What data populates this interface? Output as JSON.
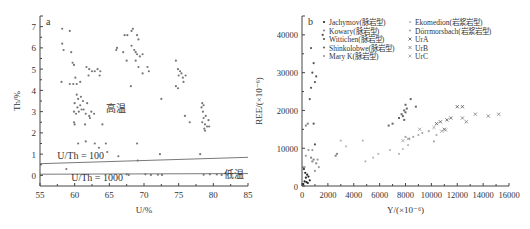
{
  "chart_data": [
    {
      "panel": "a",
      "type": "scatter",
      "title": "",
      "xlabel": "U/%",
      "ylabel": "Th/%",
      "xlim": [
        55,
        85
      ],
      "ylim": [
        -0.5,
        7.5
      ],
      "xticks": [
        55,
        60,
        65,
        70,
        75,
        80,
        85
      ],
      "yticks": [
        0,
        1,
        2,
        3,
        4,
        5,
        6,
        7
      ],
      "grid": false,
      "annotations": [
        {
          "text": "高温",
          "x": 64.5,
          "y": 3.0
        },
        {
          "text": "低温",
          "x": 81.5,
          "y": -0.1
        },
        {
          "text": "U/Th = 100",
          "x": 57.5,
          "y": 0.75
        },
        {
          "text": "U/Th = 1000",
          "x": 59.5,
          "y": -0.25
        }
      ],
      "lines": [
        {
          "label": "U/Th = 100",
          "x": [
            55,
            85
          ],
          "y": [
            0.55,
            0.85
          ]
        },
        {
          "label": "U/Th = 1000",
          "x": [
            55,
            85
          ],
          "y": [
            0.055,
            0.085
          ]
        }
      ],
      "series": [
        {
          "name": "samples",
          "points": [
            [
              58.2,
              6.9
            ],
            [
              59.3,
              6.8
            ],
            [
              58.2,
              6.2
            ],
            [
              58.4,
              5.9
            ],
            [
              59.5,
              5.8
            ],
            [
              59.7,
              5.3
            ],
            [
              59.9,
              5.2
            ],
            [
              58.1,
              4.4
            ],
            [
              59.3,
              4.3
            ],
            [
              59.8,
              4.3
            ],
            [
              60.3,
              4.3
            ],
            [
              60.8,
              4.4
            ],
            [
              60.1,
              4.6
            ],
            [
              61.7,
              5.1
            ],
            [
              62.1,
              5.0
            ],
            [
              62.5,
              4.9
            ],
            [
              62.9,
              4.9
            ],
            [
              63.3,
              5.0
            ],
            [
              63.7,
              4.9
            ],
            [
              62.0,
              4.7
            ],
            [
              63.6,
              4.7
            ],
            [
              60.3,
              3.8
            ],
            [
              60.5,
              3.6
            ],
            [
              60.9,
              3.7
            ],
            [
              61.2,
              3.5
            ],
            [
              60.0,
              3.4
            ],
            [
              60.4,
              3.2
            ],
            [
              60.8,
              3.3
            ],
            [
              61.3,
              3.1
            ],
            [
              61.8,
              3.4
            ],
            [
              59.9,
              3.0
            ],
            [
              60.2,
              2.9
            ],
            [
              60.6,
              3.0
            ],
            [
              61.0,
              3.1
            ],
            [
              61.6,
              2.9
            ],
            [
              62.1,
              2.8
            ],
            [
              62.4,
              3.0
            ],
            [
              62.8,
              2.9
            ],
            [
              62.2,
              2.7
            ],
            [
              59.9,
              2.5
            ],
            [
              60.0,
              2.4
            ],
            [
              61.5,
              2.4
            ],
            [
              64.0,
              2.4
            ],
            [
              60.5,
              1.5
            ],
            [
              61.6,
              1.6
            ],
            [
              62.9,
              1.5
            ],
            [
              64.5,
              1.5
            ],
            [
              63.5,
              1.3
            ],
            [
              64.7,
              1.1
            ],
            [
              66.3,
              0.9
            ],
            [
              58.8,
              0.3
            ],
            [
              66.1,
              6.0
            ],
            [
              66.0,
              5.9
            ],
            [
              67.2,
              6.6
            ],
            [
              67.6,
              6.6
            ],
            [
              68.4,
              6.9
            ],
            [
              68.2,
              6.8
            ],
            [
              69.0,
              6.6
            ],
            [
              69.2,
              6.4
            ],
            [
              68.2,
              6.1
            ],
            [
              68.6,
              5.9
            ],
            [
              67.0,
              5.8
            ],
            [
              68.8,
              5.8
            ],
            [
              69.0,
              5.7
            ],
            [
              69.4,
              5.6
            ],
            [
              69.8,
              5.7
            ],
            [
              68.8,
              5.4
            ],
            [
              67.5,
              5.4
            ],
            [
              69.2,
              5.1
            ],
            [
              70.5,
              5.1
            ],
            [
              70.7,
              4.9
            ],
            [
              69.8,
              4.8
            ],
            [
              68.1,
              4.2
            ],
            [
              72.5,
              3.6
            ],
            [
              69.0,
              1.5
            ],
            [
              72.3,
              1.0
            ],
            [
              69.1,
              0.7
            ],
            [
              74.6,
              5.4
            ],
            [
              74.9,
              5.0
            ],
            [
              75.2,
              4.9
            ],
            [
              75.0,
              4.7
            ],
            [
              75.4,
              4.8
            ],
            [
              75.6,
              4.6
            ],
            [
              76.0,
              4.7
            ],
            [
              75.7,
              4.4
            ],
            [
              74.6,
              4.2
            ],
            [
              74.9,
              4.1
            ],
            [
              75.9,
              2.8
            ],
            [
              76.6,
              2.5
            ],
            [
              78.4,
              3.4
            ],
            [
              78.6,
              3.3
            ],
            [
              78.3,
              3.2
            ],
            [
              78.5,
              3.0
            ],
            [
              78.9,
              2.8
            ],
            [
              78.6,
              2.7
            ],
            [
              79.3,
              2.6
            ],
            [
              78.4,
              2.5
            ],
            [
              78.8,
              2.4
            ],
            [
              79.1,
              2.3
            ],
            [
              78.7,
              2.2
            ],
            [
              79.4,
              2.3
            ],
            [
              78.8,
              2.1
            ],
            [
              78.1,
              1.0
            ],
            [
              67.5,
              0.05
            ],
            [
              67.8,
              0.02
            ],
            [
              70.2,
              0.05
            ],
            [
              71.0,
              0.02
            ],
            [
              72.0,
              0.03
            ],
            [
              72.6,
              0.02
            ],
            [
              78.6,
              0.03
            ],
            [
              79.5,
              0.05
            ],
            [
              80.5,
              0.04
            ],
            [
              81.2,
              0.02
            ],
            [
              82.0,
              0.03
            ],
            [
              82.6,
              0.02
            ]
          ]
        }
      ]
    },
    {
      "panel": "b",
      "type": "scatter",
      "title": "",
      "xlabel": "Y/(×10⁻⁶)",
      "ylabel": "REE/(×10⁻⁶)",
      "xlim": [
        0,
        16000
      ],
      "ylim": [
        0,
        45000
      ],
      "xticks": [
        0,
        2000,
        4000,
        6000,
        8000,
        10000,
        12000,
        14000,
        16000
      ],
      "yticks": [
        0,
        10000,
        20000,
        30000,
        40000
      ],
      "grid": false,
      "legend": {
        "position": "upper-left-inside",
        "columns": 2
      },
      "series": [
        {
          "name": "Jachymov(脉岩型)",
          "marker": "dot",
          "color": "#222222",
          "points": [
            [
              100,
              500
            ],
            [
              200,
              1200
            ],
            [
              300,
              2200
            ],
            [
              400,
              3000
            ],
            [
              500,
              2500
            ],
            [
              600,
              1500
            ],
            [
              150,
              4500
            ],
            [
              250,
              3500
            ],
            [
              350,
              1000
            ],
            [
              450,
              800
            ]
          ]
        },
        {
          "name": "Kowary(脉岩型)",
          "marker": "square",
          "color": "#888888",
          "points": [
            [
              300,
              16000
            ],
            [
              450,
              16500
            ],
            [
              700,
              7500
            ],
            [
              800,
              6500
            ],
            [
              900,
              7000
            ],
            [
              1100,
              6000
            ],
            [
              2600,
              8000
            ],
            [
              2700,
              8500
            ]
          ]
        },
        {
          "name": "Wittichen(脉岩型)",
          "marker": "dot",
          "color": "#555555",
          "points": [
            [
              600,
              23000
            ],
            [
              700,
              26000
            ],
            [
              800,
              30000
            ],
            [
              900,
              32500
            ],
            [
              1000,
              27500
            ],
            [
              1100,
              29000
            ],
            [
              1600,
              40000
            ],
            [
              700,
              36500
            ],
            [
              900,
              16500
            ],
            [
              1000,
              11000
            ]
          ]
        },
        {
          "name": "Shinkolobwe(脉岩型)",
          "marker": "square",
          "color": "#666666",
          "points": [
            [
              6700,
              16000
            ],
            [
              7000,
              16500
            ],
            [
              7500,
              18000
            ],
            [
              7700,
              19000
            ],
            [
              7800,
              18500
            ],
            [
              7900,
              20000
            ],
            [
              8000,
              19500
            ],
            [
              8100,
              20500
            ],
            [
              8000,
              21500
            ],
            [
              8400,
              23000
            ],
            [
              8800,
              21000
            ],
            [
              7900,
              17500
            ]
          ]
        },
        {
          "name": "Mary K(脉岩型)",
          "marker": "dot",
          "color": "#999999",
          "points": [
            [
              200,
              5000
            ],
            [
              300,
              8000
            ],
            [
              500,
              9500
            ],
            [
              800,
              9500
            ],
            [
              1000,
              4000
            ],
            [
              1200,
              7000
            ],
            [
              1300,
              5000
            ]
          ]
        },
        {
          "name": "Ekomedion(岩浆岩型)",
          "marker": "dot",
          "color": "#bbbbbb",
          "points": [
            [
              3000,
              12000
            ],
            [
              3400,
              10500
            ],
            [
              4700,
              12000
            ],
            [
              4900,
              6500
            ],
            [
              5500,
              7500
            ],
            [
              5900,
              8500
            ],
            [
              6800,
              9500
            ],
            [
              7500,
              8500
            ],
            [
              7800,
              9800
            ],
            [
              8200,
              10800
            ]
          ]
        },
        {
          "name": "Dörrmorsbach(岩浆岩型)",
          "marker": "dot",
          "color": "#aaaaaa",
          "points": [
            [
              8000,
              13000
            ],
            [
              8300,
              12500
            ],
            [
              8600,
              13000
            ],
            [
              9000,
              13500
            ],
            [
              9300,
              14000
            ],
            [
              9800,
              14500
            ],
            [
              10200,
              11800
            ],
            [
              10400,
              13500
            ]
          ]
        },
        {
          "name": "UrA",
          "marker": "x",
          "color": "#555555",
          "points": [
            [
              10400,
              16500
            ],
            [
              10700,
              17000
            ],
            [
              11000,
              15000
            ],
            [
              11200,
              17500
            ],
            [
              11500,
              18000
            ],
            [
              12000,
              21000
            ],
            [
              12400,
              21000
            ]
          ]
        },
        {
          "name": "UrB",
          "marker": "x",
          "color": "#777777",
          "points": [
            [
              12400,
              18000
            ],
            [
              12700,
              17000
            ],
            [
              13400,
              19000
            ],
            [
              14400,
              18500
            ],
            [
              15200,
              19000
            ]
          ]
        },
        {
          "name": "UrC",
          "marker": "x",
          "color": "#999999",
          "points": [
            [
              7800,
              12000
            ],
            [
              8200,
              12500
            ],
            [
              9100,
              15000
            ],
            [
              10200,
              15500
            ],
            [
              10800,
              14500
            ],
            [
              11100,
              14800
            ]
          ]
        }
      ]
    }
  ]
}
